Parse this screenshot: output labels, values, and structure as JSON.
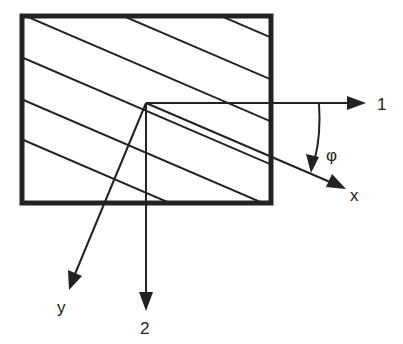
{
  "diagram": {
    "colors": {
      "stroke": "#222222",
      "background": "#ffffff"
    },
    "axes": {
      "axis_1": {
        "label": "1"
      },
      "axis_2": {
        "label": "2"
      },
      "axis_x": {
        "label": "x"
      },
      "axis_y": {
        "label": "y"
      }
    },
    "angle": {
      "label": "φ"
    }
  }
}
